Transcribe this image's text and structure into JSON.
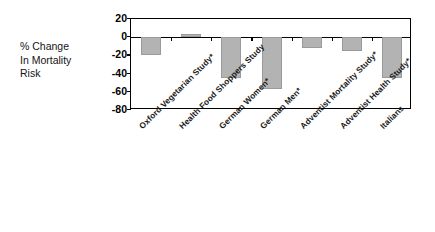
{
  "axis_caption": {
    "line1": "% Change",
    "line2": "In Mortality",
    "line3": "Risk"
  },
  "colors": {
    "bar_fill": "#b3b3b3",
    "bar_stroke": "#9a9a9a",
    "axis": "#000000",
    "background": "#ffffff"
  },
  "chart_data": {
    "type": "bar",
    "title": "",
    "xlabel": "",
    "ylabel": "% Change In Mortality Risk",
    "ylim": [
      -80,
      20
    ],
    "yticks": [
      20,
      0,
      -20,
      -40,
      -60,
      -80
    ],
    "ytick_labels": [
      "20",
      "0",
      "-20",
      "-40",
      "-60",
      "-80"
    ],
    "grid": false,
    "legend": "none",
    "categories": [
      "Oxford Vegetarian Study*",
      "Health Food Shoppers Study",
      "German Women*",
      "German Men*",
      "Adventist Mortality Study*",
      "Adventist Health Study*",
      "Italians"
    ],
    "values": [
      -20,
      3,
      -45,
      -57,
      -12,
      -15,
      -45
    ]
  }
}
